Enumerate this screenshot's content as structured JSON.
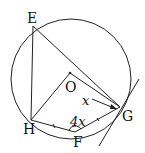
{
  "diagram": {
    "type": "circle-geometry",
    "circle": {
      "center_label": "O"
    },
    "points": [
      {
        "id": "E",
        "label": "E"
      },
      {
        "id": "O",
        "label": "O"
      },
      {
        "id": "H",
        "label": "H"
      },
      {
        "id": "F",
        "label": "F"
      },
      {
        "id": "G",
        "label": "G"
      }
    ],
    "segments": [
      "EH",
      "EG",
      "OH",
      "OG",
      "HF",
      "FG",
      "HG"
    ],
    "tangent": {
      "at": "G"
    },
    "angle_labels": {
      "angle_at_G": "x",
      "angle_at_F": "4x"
    },
    "colors": {
      "stroke": "#222222",
      "background": "#ffffff"
    }
  }
}
